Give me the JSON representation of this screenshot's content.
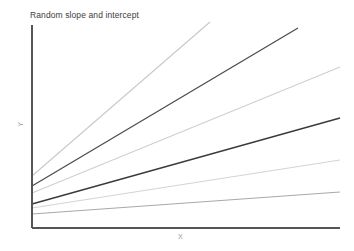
{
  "chart_data": {
    "type": "line",
    "title": "Random slope and intercept",
    "xlabel": "X",
    "ylabel": "Y",
    "grid": false,
    "legend": "none",
    "xlim": [
      0,
      10
    ],
    "ylim": [
      0,
      10
    ],
    "axis_ticks": {
      "x": [],
      "y": []
    },
    "series": [
      {
        "name": "line-1",
        "color": "#c9c9c9",
        "width": 1.1,
        "intercept": 3.45,
        "slope": 1.32,
        "x": [
          0,
          5.78
        ],
        "y": [
          3.45,
          11.08
        ],
        "px": [
          {
            "x": 32,
            "y": 176
          },
          {
            "x": 210,
            "y": 22
          }
        ]
      },
      {
        "name": "line-2",
        "color": "#4a4a4a",
        "width": 1.2,
        "intercept": 2.95,
        "slope": 0.88,
        "x": [
          0,
          8.64
        ],
        "y": [
          2.95,
          10.55
        ],
        "px": [
          {
            "x": 32,
            "y": 186
          },
          {
            "x": 298,
            "y": 28
          }
        ]
      },
      {
        "name": "line-3",
        "color": "#cfcfcf",
        "width": 1.1,
        "intercept": 2.6,
        "slope": 0.63,
        "x": [
          0,
          10.0
        ],
        "y": [
          2.6,
          8.9
        ],
        "px": [
          {
            "x": 32,
            "y": 193
          },
          {
            "x": 340,
            "y": 67
          }
        ]
      },
      {
        "name": "line-4",
        "color": "#3a3a3a",
        "width": 1.3,
        "intercept": 2.05,
        "slope": 0.38,
        "x": [
          0,
          10.0
        ],
        "y": [
          2.05,
          5.85
        ],
        "px": [
          {
            "x": 32,
            "y": 204
          },
          {
            "x": 340,
            "y": 118
          }
        ]
      },
      {
        "name": "line-5",
        "color": "#d4d4d4",
        "width": 1.1,
        "intercept": 1.86,
        "slope": 0.22,
        "x": [
          0,
          10.0
        ],
        "y": [
          1.86,
          4.06
        ],
        "px": [
          {
            "x": 32,
            "y": 208
          },
          {
            "x": 340,
            "y": 160
          }
        ]
      },
      {
        "name": "line-6",
        "color": "#a8a8a8",
        "width": 1.1,
        "intercept": 1.28,
        "slope": 0.1,
        "x": [
          0,
          10.0
        ],
        "y": [
          1.28,
          2.28
        ],
        "px": [
          {
            "x": 32,
            "y": 214
          },
          {
            "x": 340,
            "y": 192
          }
        ]
      }
    ],
    "axes": {
      "color": "#555555",
      "width": 1.2,
      "y_axis_px": {
        "x": 32,
        "y_top": 25,
        "y_bottom": 228
      },
      "x_axis_px": {
        "y": 228,
        "x_left": 32,
        "x_right": 340
      }
    },
    "colors": {
      "background": "#ffffff",
      "axis": "#555555",
      "title_text": "#3c3c3c",
      "axis_label_text": "#9a9a9a"
    }
  }
}
